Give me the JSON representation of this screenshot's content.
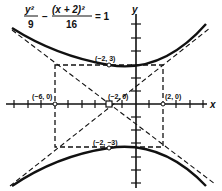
{
  "equation": {
    "term1_num": "y²",
    "term1_den": "9",
    "minus": "−",
    "term2_num": "(x + 2)²",
    "term2_den": "16",
    "rhs": "= 1"
  },
  "axes": {
    "x_label": "x",
    "y_label": "y"
  },
  "points": {
    "top_vertex": "(−2, 3)",
    "bottom_vertex": "(−2, −3)",
    "center": "(−2, 0)",
    "left_point": "(−6, 0)",
    "right_point": "(2, 0)"
  },
  "colors": {
    "ink": "#111111",
    "background": "#ffffff"
  }
}
